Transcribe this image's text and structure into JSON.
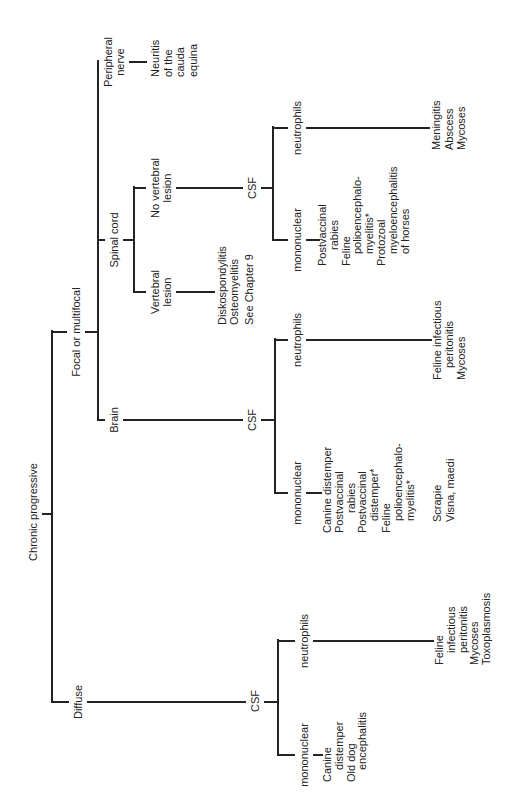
{
  "diagram": {
    "root": {
      "label": "Chronic progressive"
    },
    "diffuse": {
      "label": "Diffuse",
      "csf": {
        "label": "CSF",
        "mononuclear": {
          "label": "mononuclear",
          "findings": [
            [
              "Canine",
              "distemper"
            ],
            [
              "Old dog",
              "encephalitis"
            ]
          ]
        },
        "neutrophils": {
          "label": "neutrophils",
          "findings": [
            [
              "Feline",
              "infectious",
              "peritonitis"
            ],
            [
              "Mycoses"
            ],
            [
              "Toxoplasmosis"
            ]
          ]
        }
      }
    },
    "focal": {
      "label": "Focal or multifocal",
      "brain": {
        "label": "Brain",
        "csf": {
          "label": "CSF",
          "mononuclear": {
            "label": "mononuclear",
            "findings": [
              [
                "Canine distemper"
              ],
              [
                "Postvaccinal",
                "rabies"
              ],
              [
                "Postvaccinal",
                "distemper*"
              ],
              [
                "Feline",
                "polioencephalo-",
                "myelitis*"
              ]
            ],
            "other_findings": [
              [
                "Scrapie"
              ],
              [
                "Visna, maedi"
              ]
            ]
          },
          "neutrophils": {
            "label": "neutrophils",
            "findings": [
              [
                "Feline infectious",
                "peritonitis"
              ],
              [
                "Mycoses"
              ]
            ]
          }
        }
      },
      "spinal_cord": {
        "label": "Spinal cord",
        "vertebral_lesion": {
          "label_lines": [
            "Vertebral",
            "lesion"
          ],
          "findings": [
            [
              "Diskospondylitis"
            ],
            [
              "Osteomyelitis"
            ],
            [
              "See Chapter 9"
            ]
          ]
        },
        "no_vertebral_lesion": {
          "label_lines": [
            "No vertebral",
            "lesion"
          ],
          "csf": {
            "label": "CSF",
            "mononuclear": {
              "label": "mononuclear",
              "findings": [
                [
                  "Postvaccinal",
                  "rabies"
                ],
                [
                  "Feline",
                  "polioencephalo-",
                  "myelitis*"
                ],
                [
                  "Protozoal",
                  "myeloencephalitis",
                  "of horses"
                ]
              ]
            },
            "neutrophils": {
              "label": "neutrophils",
              "findings": [
                [
                  "Meningitis"
                ],
                [
                  "Abscess"
                ],
                [
                  "Mycoses"
                ]
              ]
            }
          }
        }
      },
      "peripheral_nerve": {
        "label_lines": [
          "Peripheral",
          "nerve"
        ],
        "findings": [
          [
            "Neuritis",
            "of the",
            "cauda",
            "equina"
          ]
        ]
      }
    }
  },
  "style": {
    "line_color": "#232323",
    "text_color": "#222222",
    "background": "#ffffff"
  }
}
